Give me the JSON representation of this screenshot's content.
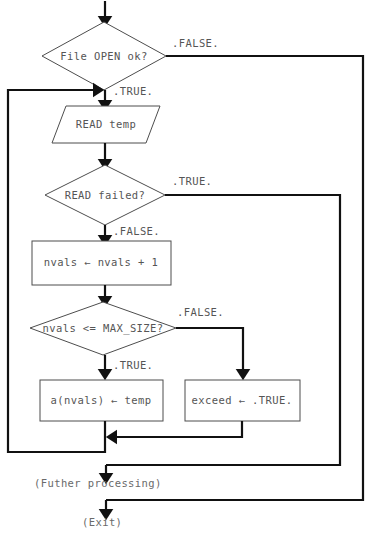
{
  "diagram": {
    "canvas": {
      "width": 374,
      "height": 539,
      "background": "#ffffff"
    },
    "colors": {
      "line": "#111111",
      "shape_stroke": "#4d4d4d",
      "shape_fill": "#ffffff",
      "text": "#555555",
      "free_text": "#6a6a6a"
    },
    "nodes": {
      "decision_file_open": {
        "label": "File OPEN ok?",
        "shape": "diamond",
        "cx": 104,
        "cy": 56,
        "rx": 62,
        "ry": 34
      },
      "io_read_temp": {
        "label": "READ temp",
        "shape": "parallelogram",
        "cx": 106,
        "cy": 124,
        "w": 108,
        "h": 37,
        "skew": 14
      },
      "decision_read_failed": {
        "label": "READ failed?",
        "shape": "diamond",
        "cx": 105,
        "cy": 195,
        "rx": 60,
        "ry": 30
      },
      "process_increment": {
        "label": "nvals ← nvals + 1",
        "shape": "rect",
        "x": 32,
        "y": 241,
        "w": 139,
        "h": 44
      },
      "decision_max_size": {
        "label": "nvals <= MAX_SIZE?",
        "shape": "diamond",
        "cx": 103,
        "cy": 328,
        "rx": 73,
        "ry": 27
      },
      "process_store": {
        "label": "a(nvals) ← temp",
        "shape": "rect",
        "x": 40,
        "y": 380,
        "w": 123,
        "h": 41
      },
      "process_exceed": {
        "label": "exceed ← .TRUE.",
        "shape": "rect",
        "x": 185,
        "y": 380,
        "w": 115,
        "h": 41
      }
    },
    "edge_labels": {
      "file_open_false": {
        "text": ".FALSE.",
        "x": 172,
        "y": 44
      },
      "file_open_true": {
        "text": ".TRUE.",
        "x": 113,
        "y": 92
      },
      "read_failed_true": {
        "text": ".TRUE.",
        "x": 172,
        "y": 182
      },
      "read_failed_false": {
        "text": ".FALSE.",
        "x": 113,
        "y": 232
      },
      "max_size_false": {
        "text": ".FALSE.",
        "x": 177,
        "y": 313
      },
      "max_size_true": {
        "text": ".TRUE.",
        "x": 113,
        "y": 366
      }
    },
    "annotations": {
      "further_processing": {
        "text": "(Futher processing)",
        "x": 34,
        "y": 483
      },
      "exit": {
        "text": "(Exit)",
        "x": 82,
        "y": 522
      }
    }
  }
}
